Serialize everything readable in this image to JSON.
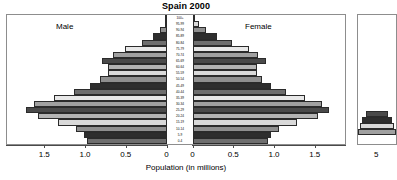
{
  "chart_data": {
    "type": "bar",
    "subtype": "population-pyramid",
    "title": "Spain 2000",
    "xlabel": "Population (in millions)",
    "ylabel": "",
    "left_series_label": "Male",
    "right_series_label": "Female",
    "categories": [
      "100+",
      "95-99",
      "90-94",
      "85-89",
      "80-84",
      "75-79",
      "70-74",
      "65-69",
      "60-64",
      "55-59",
      "50-54",
      "45-49",
      "40-44",
      "35-39",
      "30-34",
      "25-29",
      "20-24",
      "15-19",
      "10-14",
      "5-9",
      "0-4"
    ],
    "series": [
      {
        "name": "Male",
        "values": [
          0.01,
          0.03,
          0.08,
          0.17,
          0.31,
          0.52,
          0.66,
          0.8,
          0.72,
          0.73,
          0.82,
          0.94,
          1.14,
          1.39,
          1.63,
          1.73,
          1.58,
          1.34,
          1.12,
          1.02,
          0.98
        ]
      },
      {
        "name": "Female",
        "values": [
          0.02,
          0.07,
          0.16,
          0.3,
          0.48,
          0.69,
          0.8,
          0.9,
          0.79,
          0.78,
          0.85,
          0.96,
          1.14,
          1.37,
          1.58,
          1.67,
          1.53,
          1.28,
          1.06,
          0.96,
          0.92
        ]
      }
    ],
    "xlim_left": [
      0,
      1.85
    ],
    "xlim_right": [
      0,
      1.85
    ],
    "xticks_left": [
      "1.5",
      "1.0",
      "0.5",
      "0"
    ],
    "xticks_left_values": [
      1.5,
      1.0,
      0.5,
      0
    ],
    "xticks_right": [
      "0",
      "0.5",
      "1.0",
      "1.5"
    ],
    "xticks_right_values": [
      0,
      0.5,
      1.0,
      1.5
    ],
    "grid": false,
    "legend": "none",
    "bar_shades": [
      "#b4b4b4",
      "#d9d9d9",
      "#8f8f8f",
      "#2e2e2e",
      "#6e6e6e",
      "#e8e8e8",
      "#a0a0a0",
      "#4a4a4a"
    ],
    "adjacent_panel": {
      "visible_tick_label": "5"
    }
  }
}
